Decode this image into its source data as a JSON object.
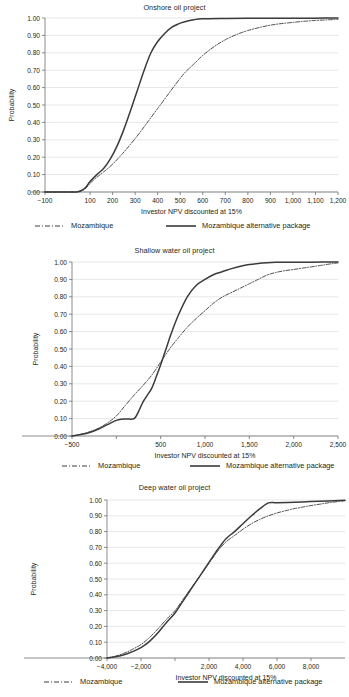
{
  "figure": {
    "axis_label_x": "Investor NPV discounted at 15%",
    "axis_label_y": "Probability",
    "legend": {
      "series_a": "Mozambique",
      "series_b": "Mozambique alternative package"
    },
    "colors": {
      "line": "#3b3b3b",
      "grid": "#d9dde0",
      "axis": "#6e6e6e",
      "text": "#231f20",
      "background": "#ffffff"
    }
  },
  "chart_data": [
    {
      "type": "line",
      "id": "onshore",
      "title": "Onshore oil project",
      "xlabel": "Investor NPV discounted at 15%",
      "ylabel": "Probability",
      "xlim": [
        -100,
        1200
      ],
      "ylim": [
        0,
        1
      ],
      "xticks": [
        -100,
        100,
        200,
        300,
        400,
        500,
        600,
        700,
        800,
        900,
        1000,
        1100,
        1200
      ],
      "xticklabels": [
        "−100",
        "100",
        "200",
        "300",
        "400",
        "500",
        "600",
        "700",
        "800",
        "900",
        "1,000",
        "1,100",
        "1,200"
      ],
      "yticks": [
        0,
        0.1,
        0.2,
        0.3,
        0.4,
        0.5,
        0.6,
        0.7,
        0.8,
        0.9,
        1
      ],
      "yticklabels": [
        "0.00",
        "0.10",
        "0.20",
        "0.30",
        "0.40",
        "0.50",
        "0.60",
        "0.70",
        "0.80",
        "0.90",
        "1.00"
      ],
      "grid": true,
      "legend_position": "below",
      "series": [
        {
          "name": "Mozambique",
          "style": "dashdot",
          "x": [
            -100,
            0,
            40,
            60,
            80,
            100,
            130,
            160,
            200,
            240,
            280,
            320,
            360,
            400,
            440,
            480,
            520,
            560,
            600,
            650,
            700,
            750,
            800,
            860,
            920,
            980,
            1040,
            1100,
            1160,
            1200
          ],
          "y": [
            0.0,
            0.0,
            0.0,
            0.005,
            0.02,
            0.05,
            0.085,
            0.115,
            0.16,
            0.215,
            0.275,
            0.34,
            0.41,
            0.48,
            0.55,
            0.62,
            0.685,
            0.735,
            0.785,
            0.835,
            0.875,
            0.905,
            0.928,
            0.948,
            0.963,
            0.972,
            0.98,
            0.986,
            0.99,
            0.992
          ]
        },
        {
          "name": "Mozambique alternative package",
          "style": "solid",
          "x": [
            -100,
            0,
            40,
            60,
            80,
            100,
            130,
            160,
            190,
            220,
            250,
            280,
            310,
            340,
            370,
            400,
            430,
            460,
            490,
            520,
            560,
            600,
            700,
            800,
            900,
            1000,
            1100,
            1200
          ],
          "y": [
            0.0,
            0.0,
            0.0,
            0.008,
            0.025,
            0.06,
            0.1,
            0.135,
            0.19,
            0.265,
            0.36,
            0.47,
            0.585,
            0.7,
            0.8,
            0.865,
            0.91,
            0.945,
            0.965,
            0.978,
            0.99,
            0.995,
            0.997,
            0.998,
            0.998,
            0.999,
            0.999,
            1.0
          ]
        }
      ]
    },
    {
      "type": "line",
      "id": "shallow",
      "title": "Shallow water oil project",
      "xlabel": "Investor NPV discounted at 15%",
      "ylabel": "Probability",
      "xlim": [
        -500,
        2500
      ],
      "ylim": [
        0,
        1
      ],
      "xticks": [
        -500,
        0,
        500,
        1000,
        1500,
        2000,
        2500
      ],
      "xticklabels": [
        "−500",
        "",
        "500",
        "1,000",
        "1,500",
        "2,000",
        "2,500"
      ],
      "yticks": [
        0,
        0.1,
        0.2,
        0.3,
        0.4,
        0.5,
        0.6,
        0.7,
        0.8,
        0.9,
        1
      ],
      "yticklabels": [
        "0.00",
        "0.10",
        "0.20",
        "0.30",
        "0.40",
        "0.50",
        "0.60",
        "0.70",
        "0.80",
        "0.90",
        "1.00"
      ],
      "grid": true,
      "legend_position": "below",
      "series": [
        {
          "name": "Mozambique",
          "style": "dashdot",
          "x": [
            -500,
            -400,
            -300,
            -200,
            -100,
            0,
            100,
            200,
            300,
            400,
            500,
            600,
            700,
            800,
            900,
            1000,
            1100,
            1200,
            1300,
            1400,
            1500,
            1600,
            1700,
            1800,
            1900,
            2000,
            2100,
            2200,
            2300,
            2400,
            2500
          ],
          "y": [
            0.0,
            0.01,
            0.025,
            0.045,
            0.075,
            0.115,
            0.175,
            0.235,
            0.29,
            0.35,
            0.425,
            0.5,
            0.565,
            0.625,
            0.675,
            0.72,
            0.765,
            0.8,
            0.825,
            0.85,
            0.875,
            0.9,
            0.925,
            0.94,
            0.95,
            0.957,
            0.965,
            0.972,
            0.98,
            0.988,
            0.995
          ]
        },
        {
          "name": "Mozambique alternative package",
          "style": "solid",
          "x": [
            -500,
            -400,
            -300,
            -200,
            -100,
            0,
            100,
            200,
            250,
            300,
            350,
            400,
            450,
            500,
            560,
            620,
            700,
            800,
            900,
            1000,
            1100,
            1200,
            1300,
            1400,
            1500,
            1600,
            1700,
            1800,
            2000,
            2200,
            2500
          ],
          "y": [
            0.0,
            0.008,
            0.02,
            0.04,
            0.065,
            0.09,
            0.098,
            0.1,
            0.14,
            0.195,
            0.235,
            0.275,
            0.34,
            0.41,
            0.5,
            0.59,
            0.695,
            0.8,
            0.865,
            0.9,
            0.928,
            0.945,
            0.962,
            0.975,
            0.985,
            0.992,
            0.996,
            0.998,
            0.999,
            0.999,
            1.0
          ]
        }
      ]
    },
    {
      "type": "line",
      "id": "deep",
      "title": "Deep water oil project",
      "xlabel": "Investor NPV discounted at 15%",
      "ylabel": "Probability",
      "xlim": [
        -4000,
        10000
      ],
      "ylim": [
        0,
        1
      ],
      "xticks": [
        -4000,
        -2000,
        0,
        2000,
        4000,
        6000,
        8000
      ],
      "xticklabels": [
        "−4,000",
        "−2,000",
        "",
        "2,000",
        "4,000",
        "6,000",
        "8,000"
      ],
      "yticks": [
        0,
        0.1,
        0.2,
        0.3,
        0.4,
        0.5,
        0.6,
        0.7,
        0.8,
        0.9,
        1
      ],
      "yticklabels": [
        "0.00",
        "0.10",
        "0.20",
        "0.30",
        "0.40",
        "0.50",
        "0.60",
        "0.70",
        "0.80",
        "0.90",
        "1.00"
      ],
      "grid": true,
      "legend_position": "below",
      "series": [
        {
          "name": "Mozambique",
          "style": "dashdot",
          "x": [
            -4000,
            -3500,
            -3000,
            -2500,
            -2000,
            -1500,
            -1000,
            -500,
            0,
            500,
            1000,
            1500,
            2000,
            2500,
            3000,
            3500,
            4000,
            4500,
            5000,
            5500,
            6000,
            6500,
            7000,
            7500,
            8000,
            8600,
            9200,
            10000
          ],
          "y": [
            0.0,
            0.012,
            0.03,
            0.055,
            0.085,
            0.13,
            0.185,
            0.245,
            0.3,
            0.375,
            0.45,
            0.525,
            0.6,
            0.675,
            0.735,
            0.775,
            0.815,
            0.85,
            0.878,
            0.9,
            0.918,
            0.932,
            0.945,
            0.955,
            0.965,
            0.975,
            0.985,
            0.995
          ]
        },
        {
          "name": "Mozambique alternative package",
          "style": "solid",
          "x": [
            -4000,
            -3500,
            -3000,
            -2500,
            -2000,
            -1500,
            -1000,
            -500,
            0,
            500,
            1000,
            1500,
            2000,
            2500,
            3000,
            3500,
            4000,
            4500,
            5000,
            5500,
            6000,
            7000,
            8000,
            9000,
            10000
          ],
          "y": [
            0.0,
            0.008,
            0.02,
            0.04,
            0.065,
            0.105,
            0.16,
            0.225,
            0.285,
            0.365,
            0.445,
            0.525,
            0.605,
            0.685,
            0.755,
            0.8,
            0.85,
            0.9,
            0.945,
            0.982,
            0.983,
            0.986,
            0.99,
            0.994,
            0.998
          ]
        }
      ]
    }
  ]
}
